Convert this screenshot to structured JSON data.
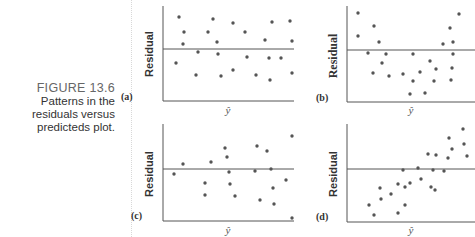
{
  "figure": {
    "number": "FIGURE 13.6",
    "caption_lines": [
      "Patterns in the",
      "residuals versus",
      "predicteds plot."
    ]
  },
  "colors": {
    "axis": "#555555",
    "points": "#555555",
    "caption_number": "#666666"
  },
  "chart_data": [
    {
      "type": "scatter",
      "panel": "(a)",
      "ylabel": "Residual",
      "xlabel": "ŷ",
      "pattern": "random scatter around zero",
      "axis_px": {
        "x0": 163,
        "y_top": 6,
        "y_axis": 101,
        "x_end": 294,
        "zero_y": 49
      },
      "points_px": [
        [
          179,
          17
        ],
        [
          184,
          32
        ],
        [
          183,
          44
        ],
        [
          176,
          63
        ],
        [
          213,
          19
        ],
        [
          208,
          32
        ],
        [
          217,
          42
        ],
        [
          198,
          52
        ],
        [
          218,
          54
        ],
        [
          196,
          75
        ],
        [
          221,
          76
        ],
        [
          233,
          23
        ],
        [
          245,
          32
        ],
        [
          247,
          57
        ],
        [
          233,
          70
        ],
        [
          256,
          75
        ],
        [
          265,
          40
        ],
        [
          272,
          22
        ],
        [
          269,
          58
        ],
        [
          281,
          58
        ],
        [
          270,
          80
        ],
        [
          290,
          21
        ],
        [
          292,
          41
        ],
        [
          292,
          73
        ]
      ]
    },
    {
      "type": "scatter",
      "panel": "(b)",
      "ylabel": "Residual",
      "xlabel": "ŷ",
      "pattern": "curved (U-shaped)",
      "axis_px": {
        "x0": 347,
        "y_top": 6,
        "y_axis": 102,
        "x_end": 475,
        "zero_y": 50
      },
      "points_px": [
        [
          358,
          13
        ],
        [
          358,
          36
        ],
        [
          374,
          26
        ],
        [
          379,
          42
        ],
        [
          368,
          53
        ],
        [
          386,
          54
        ],
        [
          382,
          63
        ],
        [
          373,
          73
        ],
        [
          389,
          76
        ],
        [
          403,
          74
        ],
        [
          413,
          54
        ],
        [
          413,
          81
        ],
        [
          410,
          94
        ],
        [
          420,
          72
        ],
        [
          425,
          93
        ],
        [
          430,
          61
        ],
        [
          436,
          69
        ],
        [
          434,
          81
        ],
        [
          443,
          44
        ],
        [
          450,
          28
        ],
        [
          453,
          42
        ],
        [
          459,
          14
        ],
        [
          453,
          54
        ],
        [
          452,
          68
        ],
        [
          451,
          80
        ]
      ]
    },
    {
      "type": "scatter",
      "panel": "(c)",
      "ylabel": "Residual",
      "xlabel": "ŷ",
      "pattern": "fanning / increasing spread",
      "axis_px": {
        "x0": 163,
        "y_top": 124,
        "y_axis": 221,
        "x_end": 294,
        "zero_y": 169
      },
      "points_px": [
        [
          174,
          174
        ],
        [
          183,
          164
        ],
        [
          211,
          162
        ],
        [
          205,
          183
        ],
        [
          205,
          195
        ],
        [
          225,
          148
        ],
        [
          227,
          157
        ],
        [
          229,
          172
        ],
        [
          230,
          184
        ],
        [
          235,
          196
        ],
        [
          257,
          146
        ],
        [
          255,
          171
        ],
        [
          267,
          151
        ],
        [
          271,
          169
        ],
        [
          273,
          188
        ],
        [
          260,
          200
        ],
        [
          274,
          204
        ],
        [
          286,
          180
        ],
        [
          292,
          136
        ],
        [
          292,
          218
        ]
      ]
    },
    {
      "type": "scatter",
      "panel": "(d)",
      "ylabel": "Residual",
      "xlabel": "ŷ",
      "pattern": "linear trend (increasing)",
      "axis_px": {
        "x0": 347,
        "y_top": 124,
        "y_axis": 222,
        "x_end": 475,
        "zero_y": 169
      },
      "points_px": [
        [
          369,
          205
        ],
        [
          374,
          215
        ],
        [
          380,
          188
        ],
        [
          381,
          199
        ],
        [
          391,
          194
        ],
        [
          398,
          213
        ],
        [
          398,
          184
        ],
        [
          405,
          187
        ],
        [
          405,
          205
        ],
        [
          403,
          170
        ],
        [
          410,
          183
        ],
        [
          418,
          168
        ],
        [
          421,
          179
        ],
        [
          428,
          154
        ],
        [
          431,
          187
        ],
        [
          435,
          190
        ],
        [
          433,
          170
        ],
        [
          436,
          155
        ],
        [
          444,
          171
        ],
        [
          449,
          138
        ],
        [
          448,
          158
        ],
        [
          452,
          149
        ],
        [
          463,
          129
        ],
        [
          464,
          144
        ],
        [
          467,
          156
        ]
      ]
    }
  ],
  "panels": {
    "a": {
      "label": "(a)",
      "ylabel": "Residual",
      "xlabel": "ŷ"
    },
    "b": {
      "label": "(b)",
      "ylabel": "Residual",
      "xlabel": "ŷ"
    },
    "c": {
      "label": "(c)",
      "ylabel": "Residual",
      "xlabel": "ŷ"
    },
    "d": {
      "label": "(d)",
      "ylabel": "Residual",
      "xlabel": "ŷ"
    }
  }
}
